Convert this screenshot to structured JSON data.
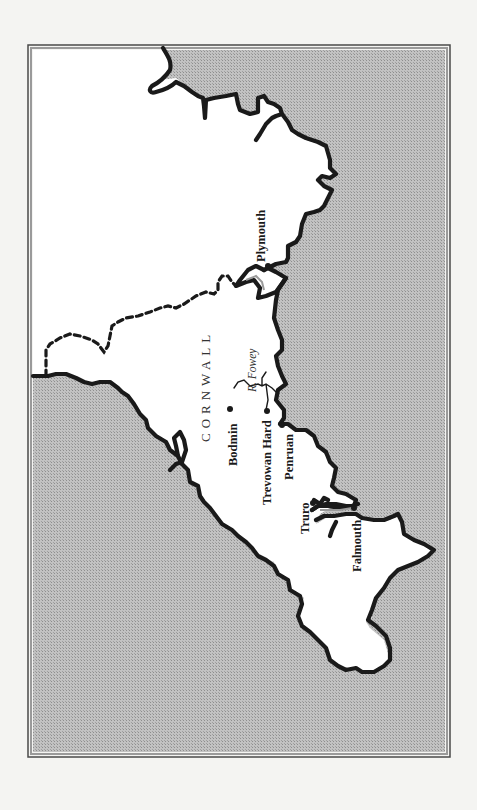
{
  "map": {
    "colors": {
      "sea": "#b4b4b4",
      "land": "#ffffff",
      "coastline": "#1a1a1a",
      "frame": "#555555",
      "page": "#f4f4f2"
    },
    "region_label": "CORNWALL",
    "river_label": "R. Fowey",
    "towns": [
      {
        "name": "Plymouth"
      },
      {
        "name": "Bodmin"
      },
      {
        "name": "Trevowan Hard"
      },
      {
        "name": "Penruan"
      },
      {
        "name": "Truro"
      },
      {
        "name": "Falmouth"
      }
    ],
    "legend": {
      "dashed_line": "county-border",
      "shaded_area": "sea"
    }
  }
}
